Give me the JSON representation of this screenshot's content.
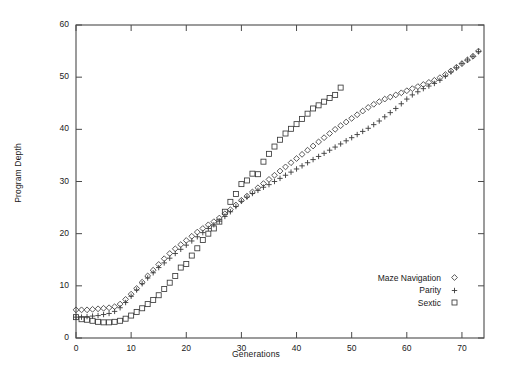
{
  "chart_data": {
    "type": "scatter",
    "title": "",
    "xlabel": "Generations",
    "ylabel": "Program Depth",
    "xlim": [
      0,
      74
    ],
    "ylim": [
      0,
      60
    ],
    "xticks": [
      0,
      10,
      20,
      30,
      40,
      50,
      60,
      70
    ],
    "yticks": [
      0,
      10,
      20,
      30,
      40,
      50,
      60
    ],
    "grid": false,
    "legend_position": "bottom-right",
    "series": [
      {
        "name": "Maze Navigation",
        "marker": "diamond",
        "color": "#3a3a3a",
        "points": [
          [
            0,
            5.4
          ],
          [
            1,
            5.4
          ],
          [
            2,
            5.4
          ],
          [
            3,
            5.5
          ],
          [
            4,
            5.6
          ],
          [
            5,
            5.7
          ],
          [
            6,
            5.8
          ],
          [
            7,
            6.0
          ],
          [
            8,
            6.5
          ],
          [
            9,
            7.4
          ],
          [
            10,
            8.4
          ],
          [
            11,
            9.5
          ],
          [
            12,
            10.7
          ],
          [
            13,
            11.9
          ],
          [
            14,
            13.0
          ],
          [
            15,
            14.1
          ],
          [
            16,
            15.2
          ],
          [
            17,
            16.2
          ],
          [
            18,
            17.1
          ],
          [
            19,
            17.9
          ],
          [
            20,
            18.7
          ],
          [
            21,
            19.5
          ],
          [
            22,
            20.3
          ],
          [
            23,
            21.0
          ],
          [
            24,
            21.7
          ],
          [
            25,
            22.3
          ],
          [
            26,
            23.0
          ],
          [
            27,
            23.8
          ],
          [
            28,
            24.6
          ],
          [
            29,
            25.5
          ],
          [
            30,
            26.4
          ],
          [
            31,
            27.2
          ],
          [
            32,
            28.0
          ],
          [
            33,
            28.8
          ],
          [
            34,
            29.6
          ],
          [
            35,
            30.4
          ],
          [
            36,
            31.2
          ],
          [
            37,
            32.0
          ],
          [
            38,
            32.8
          ],
          [
            39,
            33.6
          ],
          [
            40,
            34.4
          ],
          [
            41,
            35.2
          ],
          [
            42,
            36.0
          ],
          [
            43,
            36.8
          ],
          [
            44,
            37.6
          ],
          [
            45,
            38.4
          ],
          [
            46,
            39.2
          ],
          [
            47,
            40.0
          ],
          [
            48,
            40.7
          ],
          [
            49,
            41.4
          ],
          [
            50,
            42.1
          ],
          [
            51,
            42.8
          ],
          [
            52,
            43.5
          ],
          [
            53,
            44.2
          ],
          [
            54,
            44.8
          ],
          [
            55,
            45.3
          ],
          [
            56,
            45.8
          ],
          [
            57,
            46.2
          ],
          [
            58,
            46.6
          ],
          [
            59,
            47.0
          ],
          [
            60,
            47.4
          ],
          [
            61,
            47.8
          ],
          [
            62,
            48.2
          ],
          [
            63,
            48.6
          ],
          [
            64,
            49.0
          ],
          [
            65,
            49.4
          ],
          [
            66,
            49.9
          ],
          [
            67,
            50.5
          ],
          [
            68,
            51.2
          ],
          [
            69,
            51.9
          ],
          [
            70,
            52.6
          ],
          [
            71,
            53.3
          ],
          [
            72,
            54.0
          ],
          [
            73,
            55.0
          ]
        ]
      },
      {
        "name": "Parity",
        "marker": "plus",
        "color": "#3a3a3a",
        "points": [
          [
            0,
            4.0
          ],
          [
            1,
            4.0
          ],
          [
            2,
            4.1
          ],
          [
            3,
            4.2
          ],
          [
            4,
            4.3
          ],
          [
            5,
            4.5
          ],
          [
            6,
            4.7
          ],
          [
            7,
            5.1
          ],
          [
            8,
            5.8
          ],
          [
            9,
            6.8
          ],
          [
            10,
            8.0
          ],
          [
            11,
            9.2
          ],
          [
            12,
            10.4
          ],
          [
            13,
            11.5
          ],
          [
            14,
            12.5
          ],
          [
            15,
            13.5
          ],
          [
            16,
            14.4
          ],
          [
            17,
            15.3
          ],
          [
            18,
            16.2
          ],
          [
            19,
            17.0
          ],
          [
            20,
            17.8
          ],
          [
            21,
            18.6
          ],
          [
            22,
            19.4
          ],
          [
            23,
            20.2
          ],
          [
            24,
            21.0
          ],
          [
            25,
            21.7
          ],
          [
            26,
            22.4
          ],
          [
            27,
            23.3
          ],
          [
            28,
            24.2
          ],
          [
            29,
            25.2
          ],
          [
            30,
            26.2
          ],
          [
            31,
            27.0
          ],
          [
            32,
            27.7
          ],
          [
            33,
            28.3
          ],
          [
            34,
            28.9
          ],
          [
            35,
            29.4
          ],
          [
            36,
            30.0
          ],
          [
            37,
            30.6
          ],
          [
            38,
            31.2
          ],
          [
            39,
            31.8
          ],
          [
            40,
            32.4
          ],
          [
            41,
            33.0
          ],
          [
            42,
            33.6
          ],
          [
            43,
            34.2
          ],
          [
            44,
            34.8
          ],
          [
            45,
            35.4
          ],
          [
            46,
            36.0
          ],
          [
            47,
            36.6
          ],
          [
            48,
            37.2
          ],
          [
            49,
            37.8
          ],
          [
            50,
            38.4
          ],
          [
            51,
            39.0
          ],
          [
            52,
            39.6
          ],
          [
            53,
            40.2
          ],
          [
            54,
            40.9
          ],
          [
            55,
            41.6
          ],
          [
            56,
            42.4
          ],
          [
            57,
            43.2
          ],
          [
            58,
            44.0
          ],
          [
            59,
            44.9
          ],
          [
            60,
            45.8
          ],
          [
            61,
            46.6
          ],
          [
            62,
            47.2
          ],
          [
            63,
            47.8
          ],
          [
            64,
            48.3
          ],
          [
            65,
            48.8
          ],
          [
            66,
            49.4
          ],
          [
            67,
            50.2
          ],
          [
            68,
            51.0
          ],
          [
            69,
            51.8
          ],
          [
            70,
            52.6
          ],
          [
            71,
            53.3
          ],
          [
            72,
            54.0
          ],
          [
            73,
            54.9
          ]
        ]
      },
      {
        "name": "Sextic",
        "marker": "square",
        "color": "#3a3a3a",
        "points": [
          [
            0,
            4.0
          ],
          [
            1,
            3.6
          ],
          [
            2,
            3.5
          ],
          [
            3,
            3.3
          ],
          [
            4,
            3.1
          ],
          [
            5,
            3.0
          ],
          [
            6,
            3.0
          ],
          [
            7,
            3.1
          ],
          [
            8,
            3.3
          ],
          [
            9,
            3.7
          ],
          [
            10,
            4.3
          ],
          [
            11,
            5.0
          ],
          [
            12,
            5.7
          ],
          [
            13,
            6.5
          ],
          [
            14,
            7.3
          ],
          [
            15,
            8.2
          ],
          [
            16,
            9.4
          ],
          [
            17,
            10.6
          ],
          [
            18,
            11.9
          ],
          [
            19,
            13.5
          ],
          [
            20,
            14.2
          ],
          [
            21,
            15.8
          ],
          [
            22,
            17.2
          ],
          [
            23,
            18.8
          ],
          [
            24,
            20.0
          ],
          [
            25,
            21.0
          ],
          [
            26,
            22.3
          ],
          [
            27,
            24.2
          ],
          [
            28,
            26.1
          ],
          [
            29,
            27.6
          ],
          [
            30,
            29.5
          ],
          [
            31,
            30.2
          ],
          [
            32,
            31.5
          ],
          [
            33,
            31.4
          ],
          [
            34,
            33.8
          ],
          [
            35,
            35.3
          ],
          [
            36,
            36.7
          ],
          [
            37,
            38.0
          ],
          [
            38,
            39.2
          ],
          [
            39,
            40.1
          ],
          [
            40,
            41.0
          ],
          [
            41,
            42.0
          ],
          [
            42,
            43.0
          ],
          [
            43,
            44.0
          ],
          [
            44,
            44.6
          ],
          [
            45,
            45.3
          ],
          [
            46,
            46.0
          ],
          [
            47,
            46.6
          ],
          [
            48,
            48.0
          ]
        ]
      }
    ]
  },
  "axes": {
    "x_ticks": [
      "0",
      "10",
      "20",
      "30",
      "40",
      "50",
      "60",
      "70"
    ],
    "y_ticks": [
      "0",
      "10",
      "20",
      "30",
      "40",
      "50",
      "60"
    ],
    "x_title": "Generations",
    "y_title": "Program Depth"
  },
  "legend": {
    "entries": [
      {
        "label": "Maze Navigation",
        "marker": "diamond-icon"
      },
      {
        "label": "Parity",
        "marker": "plus-icon"
      },
      {
        "label": "Sextic",
        "marker": "square-icon"
      }
    ]
  },
  "style": {
    "axis_color": "#4a4a4a",
    "marker_color": "#3a3a3a",
    "background": "#ffffff"
  }
}
